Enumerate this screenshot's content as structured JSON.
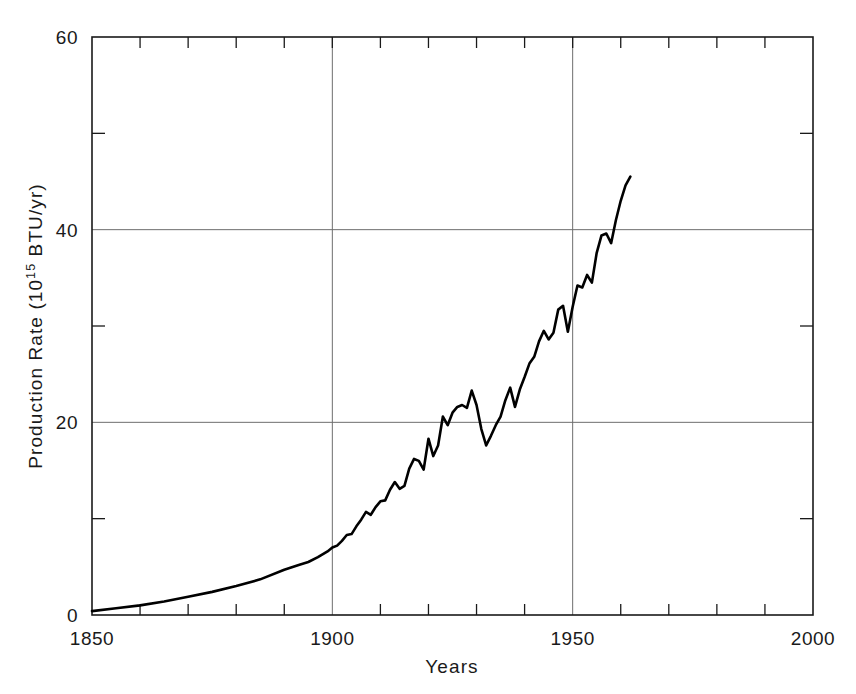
{
  "chart_data": {
    "type": "line",
    "title": "",
    "xlabel": "Years",
    "ylabel": "Production Rate (10^15 BTU/yr)",
    "ylabel_prefix": "Production Rate (10",
    "ylabel_exponent": "15",
    "ylabel_suffix": " BTU/yr)",
    "xlim": [
      1850,
      2000
    ],
    "ylim": [
      0,
      60
    ],
    "grid": "major-only",
    "legend": "none",
    "x_major_ticks": [
      1850,
      1900,
      1950,
      2000
    ],
    "x_major_tick_labels": [
      "1850",
      "1900",
      "1950",
      "2000"
    ],
    "x_minor_tick_interval": 10,
    "y_major_ticks": [
      0,
      20,
      40,
      60
    ],
    "y_major_tick_labels": [
      "0",
      "20",
      "40",
      "60"
    ],
    "y_minor_ticks": [
      10,
      30,
      50
    ],
    "line_color": "#000000",
    "line_width": 2.6,
    "series": [
      {
        "name": "World energy production rate",
        "x": [
          1850,
          1855,
          1860,
          1865,
          1870,
          1875,
          1880,
          1885,
          1890,
          1893,
          1895,
          1897,
          1899,
          1900,
          1901,
          1902,
          1903,
          1904,
          1905,
          1906,
          1907,
          1908,
          1909,
          1910,
          1911,
          1912,
          1913,
          1914,
          1915,
          1916,
          1917,
          1918,
          1919,
          1920,
          1921,
          1922,
          1923,
          1924,
          1925,
          1926,
          1927,
          1928,
          1929,
          1930,
          1931,
          1932,
          1933,
          1934,
          1935,
          1936,
          1937,
          1938,
          1939,
          1940,
          1941,
          1942,
          1943,
          1944,
          1945,
          1946,
          1947,
          1948,
          1949,
          1950,
          1951,
          1952,
          1953,
          1954,
          1955,
          1956,
          1957,
          1958,
          1959,
          1960,
          1961,
          1962
        ],
        "values": [
          0.4,
          0.7,
          1.0,
          1.4,
          1.9,
          2.4,
          3.0,
          3.7,
          4.7,
          5.2,
          5.5,
          6.0,
          6.6,
          7.0,
          7.2,
          7.7,
          8.3,
          8.4,
          9.2,
          9.9,
          10.7,
          10.4,
          11.2,
          11.8,
          11.9,
          13.0,
          13.8,
          13.1,
          13.4,
          15.2,
          16.2,
          16.0,
          15.1,
          18.3,
          16.5,
          17.6,
          20.6,
          19.7,
          21.0,
          21.6,
          21.8,
          21.5,
          23.3,
          21.8,
          19.3,
          17.6,
          18.6,
          19.7,
          20.6,
          22.3,
          23.6,
          21.6,
          23.4,
          24.7,
          26.1,
          26.8,
          28.4,
          29.5,
          28.6,
          29.3,
          31.7,
          32.1,
          29.4,
          32.0,
          34.2,
          34.0,
          35.3,
          34.5,
          37.6,
          39.4,
          39.6,
          38.6,
          41.0,
          43.0,
          44.6,
          45.5
        ]
      }
    ]
  },
  "axes": {
    "x_axis_name": "years-axis",
    "y_axis_name": "production-rate-axis"
  }
}
